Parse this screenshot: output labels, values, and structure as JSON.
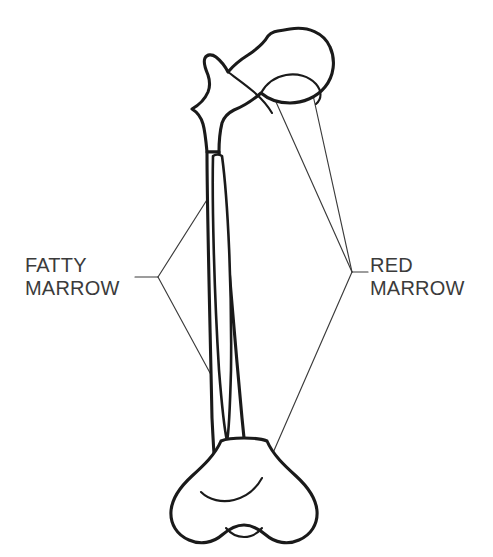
{
  "figure": {
    "background_color": "#ffffff",
    "ink_color": "#1a1a1a",
    "text_color": "#3b3b3b",
    "stipple_color": "#4a4a4a"
  },
  "labels": [
    {
      "id": "fatty-marrow",
      "line1": "FATTY",
      "line2": "MARROW",
      "side": "left",
      "text_x": 25,
      "text_y1": 272,
      "text_y2": 295,
      "vertex_x": 158,
      "vertex_y": 277,
      "stub_x": 135,
      "stub_y": 277,
      "targets": [
        {
          "x": 224,
          "y": 173
        },
        {
          "x": 222,
          "y": 395
        }
      ]
    },
    {
      "id": "red-marrow",
      "line1": "RED",
      "line2": "MARROW",
      "side": "right",
      "text_x": 370,
      "text_y1": 272,
      "text_y2": 295,
      "vertex_x": 352,
      "vertex_y": 272,
      "stub_x": 368,
      "stub_y": 272,
      "targets": [
        {
          "x": 272,
          "y": 93
        },
        {
          "x": 313,
          "y": 95
        },
        {
          "x": 262,
          "y": 478
        }
      ]
    }
  ],
  "regions": [
    {
      "id": "proximal-epiphysis",
      "name": "Proximal epiphysis (head, neck, trochanters)",
      "marrow": "red",
      "texture": "stippled"
    },
    {
      "id": "diaphysis-cavity",
      "name": "Medullary cavity of the shaft",
      "marrow": "fatty",
      "texture": "blank"
    },
    {
      "id": "distal-epiphysis",
      "name": "Distal epiphysis (condyles)",
      "marrow": "red",
      "texture": "stippled"
    }
  ]
}
